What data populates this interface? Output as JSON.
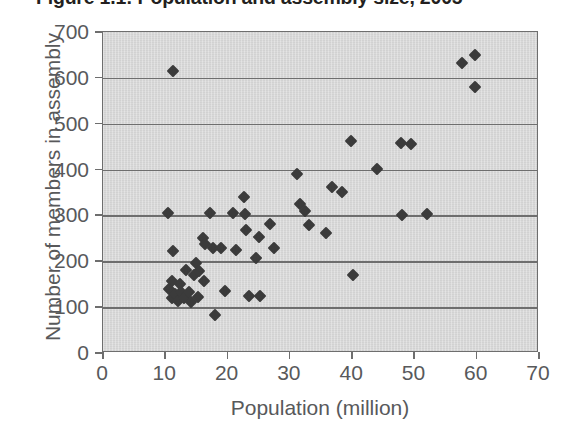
{
  "chart_data": {
    "type": "scatter",
    "title": "Figure 1.1: Population and assembly size, 2005",
    "xlabel": "Population (million)",
    "ylabel": "Number of members in assembly",
    "xlim": [
      0,
      70
    ],
    "ylim": [
      0,
      700
    ],
    "xticks": [
      0,
      10,
      20,
      30,
      40,
      50,
      60,
      70
    ],
    "yticks": [
      0,
      100,
      200,
      300,
      400,
      500,
      600,
      700
    ],
    "grid": "horizontal",
    "legend": "none",
    "marker": "diamond",
    "marker_color": "#3b3b3b",
    "plot_background": "#d9d9d9",
    "axis_color": "#6e6e6e",
    "points": [
      {
        "x": 10.4,
        "y": 305
      },
      {
        "x": 11.2,
        "y": 615
      },
      {
        "x": 11.3,
        "y": 222
      },
      {
        "x": 11.0,
        "y": 157
      },
      {
        "x": 10.6,
        "y": 140
      },
      {
        "x": 11.0,
        "y": 120
      },
      {
        "x": 11.6,
        "y": 128
      },
      {
        "x": 12.0,
        "y": 113
      },
      {
        "x": 12.3,
        "y": 150
      },
      {
        "x": 12.6,
        "y": 132
      },
      {
        "x": 13.0,
        "y": 120
      },
      {
        "x": 13.4,
        "y": 180
      },
      {
        "x": 13.8,
        "y": 132
      },
      {
        "x": 14.2,
        "y": 112
      },
      {
        "x": 14.6,
        "y": 170
      },
      {
        "x": 15.0,
        "y": 196
      },
      {
        "x": 15.4,
        "y": 178
      },
      {
        "x": 15.2,
        "y": 123
      },
      {
        "x": 16.0,
        "y": 250
      },
      {
        "x": 16.4,
        "y": 237
      },
      {
        "x": 16.2,
        "y": 158
      },
      {
        "x": 17.2,
        "y": 305
      },
      {
        "x": 17.6,
        "y": 228
      },
      {
        "x": 18.0,
        "y": 82
      },
      {
        "x": 19.0,
        "y": 228
      },
      {
        "x": 19.6,
        "y": 135
      },
      {
        "x": 20.8,
        "y": 305
      },
      {
        "x": 21.4,
        "y": 225
      },
      {
        "x": 22.6,
        "y": 340
      },
      {
        "x": 22.8,
        "y": 303
      },
      {
        "x": 23.0,
        "y": 268
      },
      {
        "x": 23.4,
        "y": 124
      },
      {
        "x": 24.6,
        "y": 208
      },
      {
        "x": 25.0,
        "y": 253
      },
      {
        "x": 25.2,
        "y": 124
      },
      {
        "x": 26.8,
        "y": 282
      },
      {
        "x": 27.4,
        "y": 228
      },
      {
        "x": 31.2,
        "y": 390
      },
      {
        "x": 31.6,
        "y": 325
      },
      {
        "x": 32.4,
        "y": 310
      },
      {
        "x": 33.0,
        "y": 280
      },
      {
        "x": 35.8,
        "y": 262
      },
      {
        "x": 36.8,
        "y": 362
      },
      {
        "x": 38.4,
        "y": 352
      },
      {
        "x": 39.8,
        "y": 462
      },
      {
        "x": 40.2,
        "y": 170
      },
      {
        "x": 44.0,
        "y": 402
      },
      {
        "x": 47.8,
        "y": 458
      },
      {
        "x": 49.4,
        "y": 456
      },
      {
        "x": 48.0,
        "y": 300
      },
      {
        "x": 52.0,
        "y": 303
      },
      {
        "x": 57.6,
        "y": 632
      },
      {
        "x": 59.8,
        "y": 650
      },
      {
        "x": 59.8,
        "y": 580
      }
    ]
  }
}
